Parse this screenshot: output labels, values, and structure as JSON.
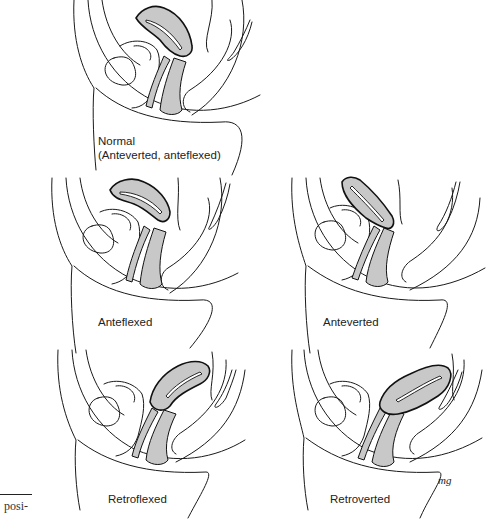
{
  "figure": {
    "panels": [
      {
        "id": "normal",
        "label_line1": "Normal",
        "label_line2": "(Anteverted, anteflexed)"
      },
      {
        "id": "anteflexed",
        "label": "Anteflexed"
      },
      {
        "id": "anteverted",
        "label": "Anteverted"
      },
      {
        "id": "retroflexed",
        "label": "Retroflexed"
      },
      {
        "id": "retroverted",
        "label": "Retroverted"
      }
    ],
    "organ_fill": "#c8c8c8",
    "line_color": "#1a1a1a",
    "artist_signature": "mg"
  },
  "margin_text": {
    "fragment": "posi-"
  }
}
